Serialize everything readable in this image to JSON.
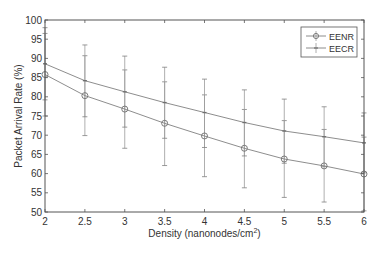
{
  "chart_data": {
    "type": "line",
    "title": "",
    "xlabel": "Density (nanonodes/cm",
    "xlabel_sup": "2",
    "xlabel_end": ")",
    "ylabel": "Packet Arrival Rate (%)",
    "x": [
      2,
      2.5,
      3,
      3.5,
      4,
      4.5,
      5,
      5.5,
      6
    ],
    "xlim": [
      2,
      6
    ],
    "ylim": [
      50,
      100
    ],
    "xticks": [
      "2",
      "2.5",
      "3",
      "3.5",
      "4",
      "4.5",
      "5",
      "5.5",
      "6"
    ],
    "yticks": [
      "50",
      "55",
      "60",
      "65",
      "70",
      "75",
      "80",
      "85",
      "90",
      "95",
      "100"
    ],
    "grid": false,
    "legend_position": "upper right",
    "series": [
      {
        "name": "EENR",
        "marker": "circle",
        "values": [
          85.8,
          80.3,
          76.8,
          73.1,
          69.8,
          66.6,
          63.8,
          62.0,
          59.9
        ],
        "err_upper": [
          96.5,
          90.7,
          87.0,
          83.9,
          80.5,
          76.7,
          73.8,
          71.5,
          69.5
        ],
        "err_lower": [
          75.0,
          69.9,
          66.6,
          62.1,
          59.2,
          56.3,
          53.8,
          52.6,
          50.3
        ]
      },
      {
        "name": "EECR",
        "marker": "point",
        "values": [
          88.6,
          84.2,
          81.3,
          78.5,
          75.9,
          73.3,
          71.1,
          69.6,
          68.0
        ],
        "err_upper": [
          98.0,
          93.5,
          90.6,
          87.7,
          84.6,
          81.8,
          79.4,
          77.4,
          75.8
        ],
        "err_lower": [
          79.2,
          74.8,
          72.1,
          69.2,
          66.8,
          64.6,
          62.7,
          61.8,
          60.2
        ]
      }
    ]
  },
  "colors": {
    "axis": "#555555",
    "line": "#808080",
    "errorbar": "#9a9a9a",
    "text": "#333333"
  }
}
